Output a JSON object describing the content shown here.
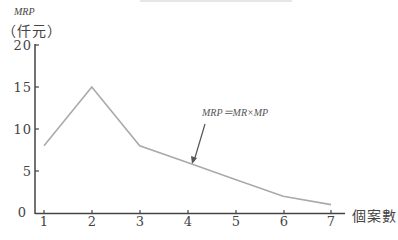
{
  "chart_data": {
    "type": "line",
    "title": "",
    "xlabel": "個案數",
    "ylabel": "MRP",
    "ylabel_unit": "（仟元）",
    "x": [
      1,
      2,
      3,
      4,
      5,
      6,
      7
    ],
    "series": [
      {
        "name": "MRP",
        "values": [
          8,
          15,
          8,
          6,
          4,
          2,
          1
        ]
      }
    ],
    "yticks": [
      "0",
      "5",
      "10",
      "15",
      "20"
    ],
    "xticks": [
      "1",
      "2",
      "3",
      "4",
      "5",
      "6",
      "7"
    ],
    "ylim": [
      0,
      20
    ],
    "xlim": [
      1,
      7
    ],
    "grid": false,
    "legend": "none",
    "annotations": [
      {
        "text": "MRP＝MR×MP",
        "arrow_to": {
          "x": 4,
          "y": 6
        }
      }
    ],
    "colors": {
      "line": "#aaaaaa",
      "axis": "#444444",
      "arrow": "#555555"
    }
  }
}
